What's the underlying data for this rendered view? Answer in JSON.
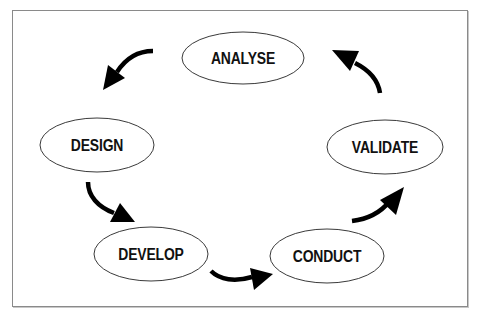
{
  "diagram": {
    "type": "cycle",
    "frame_color": "#8a8a8a",
    "nodes": [
      {
        "id": "analyse",
        "label": "ANALYSE",
        "cx": 243,
        "cy": 58,
        "rx": 61,
        "ry": 26
      },
      {
        "id": "design",
        "label": "DESIGN",
        "cx": 97,
        "cy": 145,
        "rx": 57,
        "ry": 27
      },
      {
        "id": "develop",
        "label": "DEVELOP",
        "cx": 151,
        "cy": 254,
        "rx": 57,
        "ry": 27
      },
      {
        "id": "conduct",
        "label": "CONDUCT",
        "cx": 327,
        "cy": 256,
        "rx": 57,
        "ry": 27
      },
      {
        "id": "validate",
        "label": "VALIDATE",
        "cx": 385,
        "cy": 147,
        "rx": 58,
        "ry": 27
      }
    ],
    "edges": [
      {
        "from": "analyse",
        "to": "design"
      },
      {
        "from": "design",
        "to": "develop"
      },
      {
        "from": "develop",
        "to": "conduct"
      },
      {
        "from": "conduct",
        "to": "validate"
      },
      {
        "from": "validate",
        "to": "analyse"
      }
    ]
  }
}
